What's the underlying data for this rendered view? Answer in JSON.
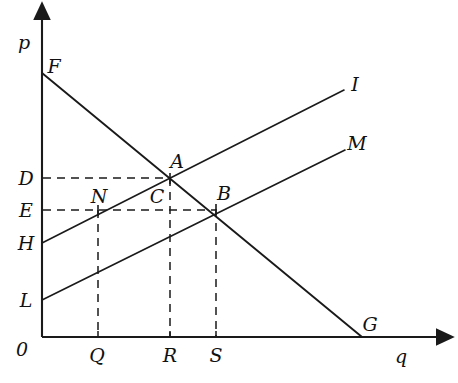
{
  "figure": {
    "type": "economics-supply-demand-diagram",
    "background_color": "#ffffff",
    "line_color": "#1a1a1a",
    "axes": {
      "origin_label": "0",
      "y_axis_label": "p",
      "x_axis_label": "q",
      "origin_px": {
        "x": 42,
        "y": 337
      },
      "y_axis_top_px": 10,
      "x_axis_right_px": 447
    },
    "y_axis_ticks": [
      {
        "label": "D",
        "y_px": 178
      },
      {
        "label": "E",
        "y_px": 210
      },
      {
        "label": "H",
        "y_px": 243
      },
      {
        "label": "L",
        "y_px": 300
      }
    ],
    "x_axis_ticks": [
      {
        "label": "Q",
        "x_px": 98
      },
      {
        "label": "R",
        "x_px": 170
      },
      {
        "label": "S",
        "x_px": 216
      }
    ],
    "curves": [
      {
        "name": "demand",
        "label": "",
        "start_label": "F",
        "end_label": "G",
        "x1": 42,
        "y1": 73,
        "x2": 362,
        "y2": 337
      },
      {
        "name": "supply-upper",
        "label": "I",
        "start_label": "H",
        "x1": 42,
        "y1": 243,
        "x2": 344,
        "y2": 90
      },
      {
        "name": "supply-lower",
        "label": "M",
        "start_label": "L",
        "x1": 42,
        "y1": 300,
        "x2": 345,
        "y2": 150
      }
    ],
    "points": [
      {
        "label": "F",
        "x": 42,
        "y": 73,
        "label_x": 54,
        "label_y": 66
      },
      {
        "label": "G",
        "x": 362,
        "y": 337,
        "label_x": 370,
        "label_y": 324
      },
      {
        "label": "A",
        "x": 170,
        "y": 178,
        "label_x": 177,
        "label_y": 161
      },
      {
        "label": "B",
        "x": 216,
        "y": 209,
        "label_x": 224,
        "label_y": 193
      },
      {
        "label": "N",
        "x": 98,
        "y": 210,
        "label_x": 99,
        "label_y": 196
      },
      {
        "label": "C",
        "x": 170,
        "y": 210,
        "label_x": 157,
        "label_y": 196
      },
      {
        "label": "I",
        "x": 344,
        "y": 90,
        "label_x": 355,
        "label_y": 84
      },
      {
        "label": "M",
        "x": 345,
        "y": 150,
        "label_x": 357,
        "label_y": 143
      }
    ],
    "guide_lines": {
      "horizontal": [
        {
          "from_label": "D",
          "to_label": "A",
          "y": 178,
          "x1": 42,
          "x2": 170
        },
        {
          "from_label": "E",
          "to_label": "B",
          "y": 210,
          "x1": 42,
          "x2": 216
        }
      ],
      "vertical": [
        {
          "from_label": "N",
          "to_label": "Q",
          "x": 98,
          "y1": 210,
          "y2": 337
        },
        {
          "from_label": "A",
          "to_label": "R",
          "x": 170,
          "y1": 178,
          "y2": 337
        },
        {
          "from_label": "B",
          "to_label": "S",
          "x": 216,
          "y1": 209,
          "y2": 337
        }
      ]
    },
    "axis_labels": {
      "p": {
        "x": 24,
        "y": 42
      },
      "q": {
        "x": 401,
        "y": 356
      },
      "zero": {
        "x": 22,
        "y": 349
      }
    },
    "tick_label_positions": {
      "D": {
        "x": 26,
        "y": 178
      },
      "E": {
        "x": 26,
        "y": 210
      },
      "H": {
        "x": 26,
        "y": 243
      },
      "L": {
        "x": 26,
        "y": 300
      },
      "Q": {
        "x": 97,
        "y": 355
      },
      "R": {
        "x": 170,
        "y": 355
      },
      "S": {
        "x": 216,
        "y": 355
      }
    }
  }
}
